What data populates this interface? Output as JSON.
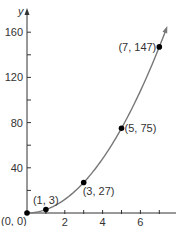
{
  "chart_data": {
    "type": "scatter",
    "title": "",
    "xlabel": "",
    "ylabel": "y",
    "xlim": [
      0,
      8
    ],
    "ylim": [
      0,
      165
    ],
    "x_ticks": [
      2,
      4,
      6
    ],
    "x_minor_ticks": [
      1,
      2,
      3,
      4,
      5,
      6,
      7
    ],
    "y_ticks": [
      40,
      80,
      120,
      160
    ],
    "y_minor_ticks": [
      20,
      40,
      60,
      80,
      100,
      120,
      140,
      160
    ],
    "grid": false,
    "curve": {
      "description": "smooth increasing curve through points, arrow at upper end",
      "x_range": [
        0,
        7.35
      ],
      "equation": "y = 3x^2"
    },
    "points": [
      {
        "x": 0,
        "y": 0,
        "label": "(0, 0)"
      },
      {
        "x": 1,
        "y": 3,
        "label": "(1, 3)"
      },
      {
        "x": 3,
        "y": 27,
        "label": "(3, 27)"
      },
      {
        "x": 5,
        "y": 75,
        "label": "(5, 75)"
      },
      {
        "x": 7,
        "y": 147,
        "label": "(7, 147)"
      }
    ],
    "colors": {
      "axis": "#333333",
      "curve": "#777777",
      "point": "#000000"
    }
  }
}
